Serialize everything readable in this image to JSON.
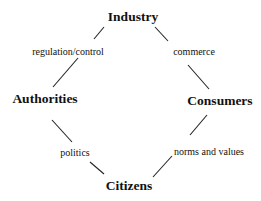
{
  "diagram": {
    "nodes": [
      {
        "id": "industry",
        "label": "Industry",
        "x": 133,
        "y": 17
      },
      {
        "id": "authorities",
        "label": "Authorities",
        "x": 45,
        "y": 99
      },
      {
        "id": "consumers",
        "label": "Consumers",
        "x": 220,
        "y": 101
      },
      {
        "id": "citizens",
        "label": "Citizens",
        "x": 129,
        "y": 186
      }
    ],
    "edges": [
      {
        "from": "industry",
        "to": "authorities",
        "label": "regulation/control",
        "label_x": 68,
        "label_y": 52
      },
      {
        "from": "industry",
        "to": "consumers",
        "label": "commerce",
        "label_x": 194,
        "label_y": 52
      },
      {
        "from": "authorities",
        "to": "citizens",
        "label": "politics",
        "label_x": 75,
        "label_y": 153
      },
      {
        "from": "consumers",
        "to": "citizens",
        "label": "norms and values",
        "label_x": 209,
        "label_y": 152
      }
    ],
    "line_color": "#222222"
  }
}
